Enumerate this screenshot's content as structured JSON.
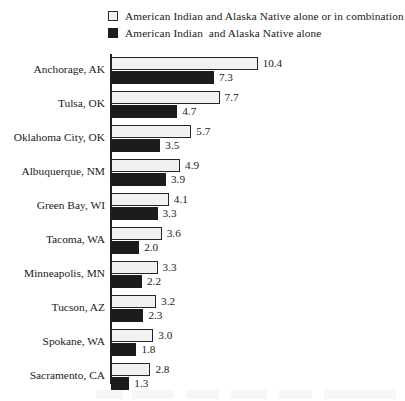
{
  "chart_data": {
    "type": "bar",
    "orientation": "horizontal",
    "title": "",
    "xlabel": "",
    "ylabel": "",
    "xlim": [
      0,
      10.4
    ],
    "grid": false,
    "legend_position": "top",
    "value_label_precision": 1,
    "categories": [
      "Anchorage, AK",
      "Tulsa, OK",
      "Oklahoma City, OK",
      "Albuquerque, NM",
      "Green Bay, WI",
      "Tacoma, WA",
      "Minneapolis, MN",
      "Tucson, AZ",
      "Spokane, WA",
      "Sacramento, CA"
    ],
    "series": [
      {
        "name": "American Indian and Alaska Native alone or in combination",
        "color": "#f1f1ef",
        "values": [
          10.4,
          7.7,
          5.7,
          4.9,
          4.1,
          3.6,
          3.3,
          3.2,
          3.0,
          2.8
        ],
        "labels": [
          "10.4",
          "7.7",
          "5.7",
          "4.9",
          "4.1",
          "3.6",
          "3.3",
          "3.2",
          "3.0",
          "2.8"
        ]
      },
      {
        "name": "American Indian  and Alaska Native alone",
        "color": "#1c1c1c",
        "values": [
          7.3,
          4.7,
          3.5,
          3.9,
          3.3,
          2.0,
          2.2,
          2.3,
          1.8,
          1.3
        ],
        "labels": [
          "7.3",
          "4.7",
          "3.5",
          "3.9",
          "3.3",
          "2.0",
          "2.2",
          "2.3",
          "1.8",
          "1.3"
        ]
      }
    ]
  },
  "legend": {
    "items": [
      {
        "label": "American Indian and Alaska Native alone or in combination",
        "swatch": "light"
      },
      {
        "label": "American Indian  and Alaska Native alone",
        "swatch": "dark"
      }
    ]
  },
  "colors": {
    "series_light": "#f1f1ef",
    "series_dark": "#1c1c1c",
    "axis": "#1f1f1f",
    "text": "#1a1a1a",
    "background": "#ffffff"
  }
}
